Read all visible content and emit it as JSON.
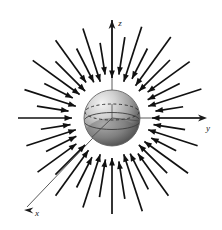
{
  "figure": {
    "background_color": "#ffffff",
    "width": 222,
    "height": 230
  },
  "axes": {
    "origin": {
      "x": 112,
      "y": 118
    },
    "color": "#555555",
    "label_color": "#1a1a1a",
    "items": [
      {
        "name": "z",
        "label": "z",
        "label_x": 120,
        "label_y": 26,
        "tip_x": 112,
        "tip_y": 22,
        "tail_x": 112,
        "tail_y": 118,
        "arrow": true
      },
      {
        "name": "y",
        "label": "y",
        "label_x": 208,
        "label_y": 131,
        "tip_x": 206,
        "tip_y": 118,
        "tail_x": 112,
        "tail_y": 118,
        "arrow": true
      },
      {
        "name": "x",
        "label": "x",
        "label_x": 37,
        "label_y": 216,
        "tip_x": 25,
        "tip_y": 209,
        "tail_x": 112,
        "tail_y": 118,
        "arrow": true
      }
    ]
  },
  "sphere": {
    "center_x": 112,
    "center_y": 118,
    "radius": 28,
    "highlight_color": "#e9e9e9",
    "mid_color": "#b3b3b3",
    "shadow_color": "#3a3a3a",
    "outline_color": "#555555",
    "equator_style": "dashed",
    "equator_color": "#333333",
    "lower_band_color": "#8c8c8c"
  },
  "vector_field": {
    "direction": "inward",
    "description": "Arrows point radially inward toward the sphere surface",
    "arrow_color": "#111111",
    "arrow_count": 40,
    "inner_radius": 34,
    "outer_radius_min": 62,
    "outer_radius_max": 104,
    "arrows": [
      {
        "angle": 90,
        "r_tail": 98,
        "r_head": 40
      },
      {
        "angle": 81,
        "r_tail": 82,
        "r_head": 44
      },
      {
        "angle": 72,
        "r_tail": 96,
        "r_head": 38
      },
      {
        "angle": 63,
        "r_tail": 78,
        "r_head": 44
      },
      {
        "angle": 54,
        "r_tail": 100,
        "r_head": 40
      },
      {
        "angle": 45,
        "r_tail": 82,
        "r_head": 38
      },
      {
        "angle": 36,
        "r_tail": 96,
        "r_head": 44
      },
      {
        "angle": 27,
        "r_tail": 76,
        "r_head": 40
      },
      {
        "angle": 18,
        "r_tail": 94,
        "r_head": 38
      },
      {
        "angle": 9,
        "r_tail": 72,
        "r_head": 44
      },
      {
        "angle": 0,
        "r_tail": 92,
        "r_head": 40
      },
      {
        "angle": 351,
        "r_tail": 74,
        "r_head": 42
      },
      {
        "angle": 342,
        "r_tail": 90,
        "r_head": 38
      },
      {
        "angle": 333,
        "r_tail": 72,
        "r_head": 44
      },
      {
        "angle": 324,
        "r_tail": 94,
        "r_head": 40
      },
      {
        "angle": 315,
        "r_tail": 78,
        "r_head": 38
      },
      {
        "angle": 306,
        "r_tail": 96,
        "r_head": 44
      },
      {
        "angle": 297,
        "r_tail": 80,
        "r_head": 40
      },
      {
        "angle": 288,
        "r_tail": 98,
        "r_head": 38
      },
      {
        "angle": 279,
        "r_tail": 82,
        "r_head": 44
      },
      {
        "angle": 270,
        "r_tail": 96,
        "r_head": 40
      },
      {
        "angle": 261,
        "r_tail": 80,
        "r_head": 42
      },
      {
        "angle": 252,
        "r_tail": 94,
        "r_head": 38
      },
      {
        "angle": 243,
        "r_tail": 78,
        "r_head": 44
      },
      {
        "angle": 234,
        "r_tail": 96,
        "r_head": 40
      },
      {
        "angle": 225,
        "r_tail": 80,
        "r_head": 38
      },
      {
        "angle": 216,
        "r_tail": 92,
        "r_head": 44
      },
      {
        "angle": 207,
        "r_tail": 74,
        "r_head": 40
      },
      {
        "angle": 198,
        "r_tail": 90,
        "r_head": 38
      },
      {
        "angle": 189,
        "r_tail": 72,
        "r_head": 42
      },
      {
        "angle": 180,
        "r_tail": 94,
        "r_head": 40
      },
      {
        "angle": 171,
        "r_tail": 76,
        "r_head": 44
      },
      {
        "angle": 162,
        "r_tail": 92,
        "r_head": 38
      },
      {
        "angle": 153,
        "r_tail": 76,
        "r_head": 44
      },
      {
        "angle": 144,
        "r_tail": 98,
        "r_head": 40
      },
      {
        "angle": 135,
        "r_tail": 80,
        "r_head": 38
      },
      {
        "angle": 126,
        "r_tail": 96,
        "r_head": 44
      },
      {
        "angle": 117,
        "r_tail": 78,
        "r_head": 40
      },
      {
        "angle": 108,
        "r_tail": 94,
        "r_head": 38
      },
      {
        "angle": 99,
        "r_tail": 76,
        "r_head": 44
      }
    ]
  }
}
